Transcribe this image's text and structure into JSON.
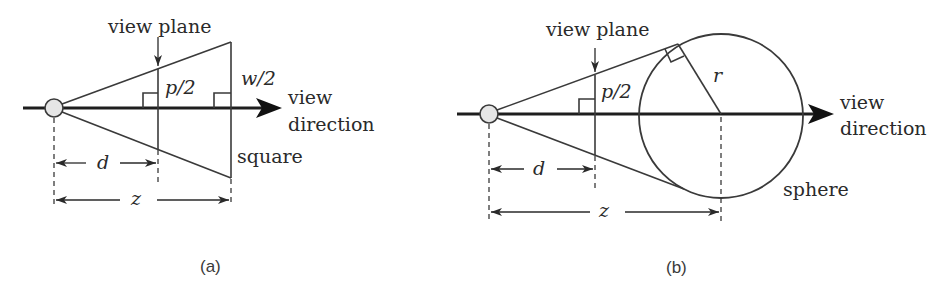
{
  "figure": {
    "panels": [
      {
        "id": "a",
        "caption": "(a)",
        "view_plane_label": "view plane",
        "half_extent_plane_label": "p/2",
        "half_width_label": "w/2",
        "view_direction_label_line1": "view",
        "view_direction_label_line2": "direction",
        "object_label": "square",
        "distance_d_label": "d",
        "distance_z_label": "z"
      },
      {
        "id": "b",
        "caption": "(b)",
        "view_plane_label": "view plane",
        "half_extent_plane_label": "p/2",
        "radius_label": "r",
        "view_direction_label_line1": "view",
        "view_direction_label_line2": "direction",
        "object_label": "sphere",
        "distance_d_label": "d",
        "distance_z_label": "z"
      }
    ],
    "colors": {
      "line": "#3a3a3a",
      "axis": "#1e1e1e",
      "eye_fill": "#e6e6e6",
      "text": "#2a2a2a"
    }
  }
}
